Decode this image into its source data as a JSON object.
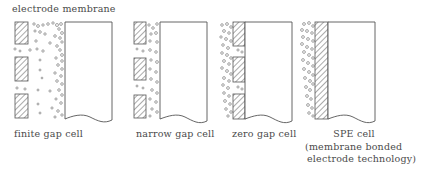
{
  "header": {
    "label": "electrode membrane"
  },
  "cells": [
    {
      "id": "finite",
      "label": "finite gap cell"
    },
    {
      "id": "narrow",
      "label": "narrow gap cell"
    },
    {
      "id": "zero",
      "label": "zero gap cell"
    },
    {
      "id": "spe",
      "label": "SPE cell",
      "sublabel_1": "(membrane bonded",
      "sublabel_2": "electrode technology)"
    }
  ],
  "colors": {
    "line": "#555555",
    "background": "#ffffff"
  }
}
